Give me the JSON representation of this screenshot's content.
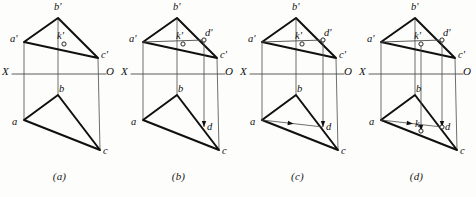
{
  "figure": {
    "type": "engineering-drawing",
    "background_color": "#fdfdfb",
    "line_color": "#101010",
    "thin_line_color": "#4a4a4a",
    "panel_width": 119,
    "panel_height": 197
  },
  "axis": {
    "x_label": "X",
    "o_label": "O",
    "y": 74
  },
  "geometry": {
    "upper": {
      "a_prime": {
        "x": 24,
        "y": 42
      },
      "b_prime": {
        "x": 58,
        "y": 18
      },
      "c_prime": {
        "x": 98,
        "y": 58
      },
      "k_prime": {
        "x": 64,
        "y": 44
      },
      "d_prime": {
        "x": 85,
        "y": 40
      }
    },
    "lower": {
      "a": {
        "x": 24,
        "y": 120
      },
      "b": {
        "x": 58,
        "y": 95
      },
      "c": {
        "x": 100,
        "y": 150
      },
      "k": {
        "x": 64,
        "y": 131
      },
      "d": {
        "x": 85,
        "y": 127
      }
    }
  },
  "panels": [
    {
      "id": "a",
      "caption": "(a)",
      "labels": [
        {
          "name": "a-prime",
          "text": "a'",
          "x": 10,
          "y": 34
        },
        {
          "name": "b-prime",
          "text": "b'",
          "x": 54,
          "y": 2
        },
        {
          "name": "c-prime",
          "text": "c'",
          "x": 101,
          "y": 50
        },
        {
          "name": "k-prime",
          "text": "k'",
          "x": 57,
          "y": 31
        },
        {
          "name": "a",
          "text": "a",
          "x": 12,
          "y": 117
        },
        {
          "name": "b",
          "text": "b",
          "x": 59,
          "y": 84
        },
        {
          "name": "c",
          "text": "c",
          "x": 103,
          "y": 146
        },
        {
          "name": "axis-x",
          "text": "X",
          "x": 2,
          "y": 66
        },
        {
          "name": "axis-o",
          "text": "O",
          "x": 106,
          "y": 66
        }
      ],
      "features": {
        "upper_triangle": true,
        "lower_triangle": true,
        "projectors": true,
        "k_marker": true,
        "ad_line_upper": false,
        "ad_line_lower": false,
        "d_marker": false,
        "k_marker_lower": false,
        "arrows_down": 0,
        "arrow_lower_horizontal": false
      }
    },
    {
      "id": "b",
      "caption": "(b)",
      "labels": [
        {
          "name": "a-prime",
          "text": "a'",
          "x": 10,
          "y": 34
        },
        {
          "name": "b-prime",
          "text": "b'",
          "x": 54,
          "y": 2
        },
        {
          "name": "c-prime",
          "text": "c'",
          "x": 101,
          "y": 50
        },
        {
          "name": "k-prime",
          "text": "k'",
          "x": 57,
          "y": 31
        },
        {
          "name": "d-prime",
          "text": "d'",
          "x": 86,
          "y": 28
        },
        {
          "name": "a",
          "text": "a",
          "x": 12,
          "y": 117
        },
        {
          "name": "b",
          "text": "b",
          "x": 59,
          "y": 84
        },
        {
          "name": "c",
          "text": "c",
          "x": 103,
          "y": 146
        },
        {
          "name": "d",
          "text": "d",
          "x": 88,
          "y": 122
        },
        {
          "name": "axis-x",
          "text": "X",
          "x": 2,
          "y": 66
        },
        {
          "name": "axis-o",
          "text": "O",
          "x": 106,
          "y": 66
        }
      ],
      "features": {
        "upper_triangle": true,
        "lower_triangle": true,
        "projectors": true,
        "k_marker": true,
        "ad_line_upper": true,
        "ad_line_lower": false,
        "d_marker": true,
        "k_marker_lower": false,
        "arrows_down": 1,
        "arrow_lower_horizontal": false
      }
    },
    {
      "id": "c",
      "caption": "(c)",
      "labels": [
        {
          "name": "a-prime",
          "text": "a'",
          "x": 10,
          "y": 34
        },
        {
          "name": "b-prime",
          "text": "b'",
          "x": 54,
          "y": 2
        },
        {
          "name": "c-prime",
          "text": "c'",
          "x": 101,
          "y": 50
        },
        {
          "name": "k-prime",
          "text": "k'",
          "x": 57,
          "y": 31
        },
        {
          "name": "d-prime",
          "text": "d'",
          "x": 86,
          "y": 28
        },
        {
          "name": "a",
          "text": "a",
          "x": 12,
          "y": 117
        },
        {
          "name": "b",
          "text": "b",
          "x": 59,
          "y": 84
        },
        {
          "name": "c",
          "text": "c",
          "x": 103,
          "y": 146
        },
        {
          "name": "d",
          "text": "d",
          "x": 88,
          "y": 122
        },
        {
          "name": "axis-x",
          "text": "X",
          "x": 2,
          "y": 66
        },
        {
          "name": "axis-o",
          "text": "O",
          "x": 106,
          "y": 66
        }
      ],
      "features": {
        "upper_triangle": true,
        "lower_triangle": true,
        "projectors": true,
        "k_marker": true,
        "ad_line_upper": true,
        "ad_line_lower": true,
        "d_marker": true,
        "k_marker_lower": false,
        "arrows_down": 1,
        "arrow_lower_horizontal": true
      }
    },
    {
      "id": "d",
      "caption": "(d)",
      "labels": [
        {
          "name": "a-prime",
          "text": "a'",
          "x": 10,
          "y": 34
        },
        {
          "name": "b-prime",
          "text": "b'",
          "x": 54,
          "y": 2
        },
        {
          "name": "c-prime",
          "text": "c'",
          "x": 101,
          "y": 50
        },
        {
          "name": "k-prime",
          "text": "k'",
          "x": 57,
          "y": 31
        },
        {
          "name": "d-prime",
          "text": "d'",
          "x": 86,
          "y": 28
        },
        {
          "name": "a",
          "text": "a",
          "x": 12,
          "y": 117
        },
        {
          "name": "b",
          "text": "b",
          "x": 59,
          "y": 84
        },
        {
          "name": "c",
          "text": "c",
          "x": 103,
          "y": 146
        },
        {
          "name": "d",
          "text": "d",
          "x": 88,
          "y": 122
        },
        {
          "name": "k",
          "text": "k",
          "x": 58,
          "y": 119
        },
        {
          "name": "axis-x",
          "text": "X",
          "x": 2,
          "y": 66
        },
        {
          "name": "axis-o",
          "text": "O",
          "x": 106,
          "y": 66
        }
      ],
      "features": {
        "upper_triangle": true,
        "lower_triangle": true,
        "projectors": true,
        "k_marker": true,
        "ad_line_upper": true,
        "ad_line_lower": true,
        "d_marker": true,
        "k_marker_lower": true,
        "arrows_down": 2,
        "arrow_lower_horizontal": true
      }
    }
  ]
}
